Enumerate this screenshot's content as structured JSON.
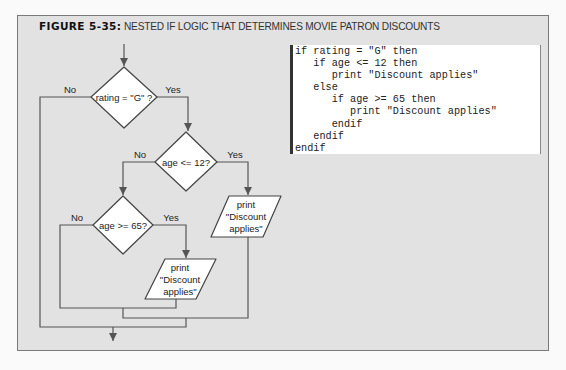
{
  "figure": {
    "label": "FIGURE 5-35:",
    "title": "NESTED IF LOGIC THAT DETERMINES MOVIE PATRON DISCOUNTS"
  },
  "flowchart": {
    "decisions": [
      {
        "id": "d1",
        "text": "rating = \"G\" ?",
        "no_label": "No",
        "yes_label": "Yes"
      },
      {
        "id": "d2",
        "text": "age <= 12?",
        "no_label": "No",
        "yes_label": "Yes"
      },
      {
        "id": "d3",
        "text": "age >= 65?",
        "no_label": "No",
        "yes_label": "Yes"
      }
    ],
    "outputs": [
      {
        "id": "p1",
        "lines": [
          "print",
          "\"Discount",
          "applies\""
        ]
      },
      {
        "id": "p2",
        "lines": [
          "print",
          "\"Discount",
          "applies\""
        ]
      }
    ]
  },
  "pseudocode": {
    "lines": [
      "if rating = \"G\" then",
      "   if age <= 12 then",
      "      print \"Discount applies\"",
      "   else",
      "      if age >= 65 then",
      "         print \"Discount applies\"",
      "      endif",
      "   endif",
      "endif"
    ]
  },
  "colors": {
    "background": "#e2e2e2",
    "shape_fill": "#ffffff",
    "line": "#555555"
  }
}
